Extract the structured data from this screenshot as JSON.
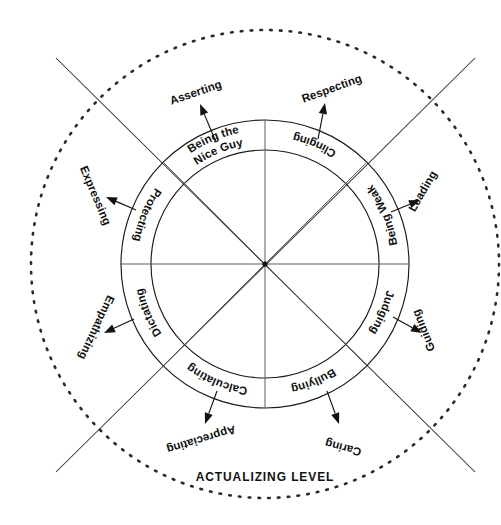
{
  "diagram": {
    "caption": "ACTUALIZING LEVEL",
    "geometry": {
      "center_x": 265,
      "center_y": 264,
      "inner_radius": 114,
      "outer_radius": 144,
      "dotted_radius": 234
    },
    "colors": {
      "stroke": "#1a1a1a",
      "spoke": "#555555",
      "dotted": "#2a2a2a",
      "background": "#ffffff",
      "text": "#111111"
    },
    "ring_segments": [
      {
        "id": "bullying",
        "label": "Bullying",
        "angle_deg": 292.5,
        "pair": "asserting"
      },
      {
        "id": "calculating",
        "label": "Calculating",
        "angle_deg": 247.5,
        "pair": "respecting"
      },
      {
        "id": "dictating",
        "label": "Dictating",
        "angle_deg": 202.5,
        "pair": "leading"
      },
      {
        "id": "protecting",
        "label": "Protecting",
        "angle_deg": 157.5,
        "pair": "guiding"
      },
      {
        "id": "being-the-nice-guy",
        "label": "Being the Nice Guy",
        "angle_deg": 112.5,
        "pair": "caring"
      },
      {
        "id": "clinging",
        "label": "Clinging",
        "angle_deg": 67.5,
        "pair": "appreciating"
      },
      {
        "id": "being-weak",
        "label": "Being Weak",
        "angle_deg": 22.5,
        "pair": "empathizing"
      },
      {
        "id": "judging",
        "label": "Judging",
        "angle_deg": 337.5,
        "pair": "expressing"
      }
    ],
    "outer_labels": [
      {
        "id": "asserting",
        "label": "Asserting",
        "x": 197,
        "y": 96,
        "rotate": -19
      },
      {
        "id": "respecting",
        "label": "Respecting",
        "x": 333,
        "y": 92,
        "rotate": -20
      },
      {
        "id": "leading",
        "label": "Leading",
        "x": 426,
        "y": 193,
        "rotate": -60
      },
      {
        "id": "guiding",
        "label": "Guiding",
        "x": 427,
        "y": 329,
        "rotate": -112
      },
      {
        "id": "caring",
        "label": "Caring",
        "x": 344,
        "y": 444,
        "rotate": -165
      },
      {
        "id": "appreciating",
        "label": "Appreciating",
        "x": 200,
        "y": 436,
        "rotate": -197
      },
      {
        "id": "empathizing",
        "label": "Empathizing",
        "x": 93,
        "y": 326,
        "rotate": -245
      },
      {
        "id": "expressing",
        "label": "Expressing",
        "x": 92,
        "y": 197,
        "rotate": -293
      }
    ],
    "arrows": [
      {
        "id": "arrow-asserting",
        "from_x": 216,
        "from_y": 142,
        "to_x": 200,
        "to_y": 104
      },
      {
        "id": "arrow-respecting",
        "from_x": 318,
        "from_y": 139,
        "to_x": 325,
        "to_y": 103
      },
      {
        "id": "arrow-leading",
        "from_x": 391,
        "from_y": 212,
        "to_x": 420,
        "to_y": 200
      },
      {
        "id": "arrow-guiding",
        "from_x": 393,
        "from_y": 317,
        "to_x": 422,
        "to_y": 333
      },
      {
        "id": "arrow-caring",
        "from_x": 327,
        "from_y": 391,
        "to_x": 339,
        "to_y": 424
      },
      {
        "id": "arrow-appreciating",
        "from_x": 217,
        "from_y": 391,
        "to_x": 205,
        "to_y": 424
      },
      {
        "id": "arrow-empathizing",
        "from_x": 134,
        "from_y": 319,
        "to_x": 104,
        "to_y": 333
      },
      {
        "id": "arrow-expressing",
        "from_x": 136,
        "from_y": 210,
        "to_x": 106,
        "to_y": 197
      }
    ],
    "diagonals": [
      {
        "id": "diagonal-nw-se",
        "x1": 56,
        "y1": 58,
        "x2": 475,
        "y2": 472
      },
      {
        "id": "diagonal-ne-sw",
        "x1": 475,
        "y1": 58,
        "x2": 56,
        "y2": 472
      }
    ],
    "spokes": [
      {
        "id": "spoke-vertical",
        "x1": 265,
        "y1": 120,
        "x2": 265,
        "y2": 408
      },
      {
        "id": "spoke-horizontal",
        "x1": 121,
        "y1": 264,
        "x2": 409,
        "y2": 264
      },
      {
        "id": "spoke-diagonal-nwse",
        "x1": 163,
        "y1": 162,
        "x2": 367,
        "y2": 366
      },
      {
        "id": "spoke-diagonal-nesw",
        "x1": 367,
        "y1": 162,
        "x2": 163,
        "y2": 366
      }
    ],
    "caption_position": {
      "x": 265,
      "y": 481
    }
  }
}
